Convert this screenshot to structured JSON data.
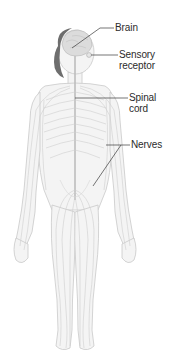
{
  "diagram": {
    "colors": {
      "background": "#ffffff",
      "body_fill": "#f4f4f4",
      "body_outline": "#c9c9c9",
      "nerve_lines": "#cfcfcf",
      "spine": "#bdbdbd",
      "brain": "#dcdcdc",
      "hair": "#6e6e6e",
      "leader_lines": "#3a3a3a",
      "label_text": "#2b2b2b"
    },
    "labels": [
      {
        "id": "brain",
        "lines": [
          "Brain"
        ]
      },
      {
        "id": "sensory-receptor",
        "lines": [
          "Sensory",
          "receptor"
        ]
      },
      {
        "id": "spinal-cord",
        "lines": [
          "Spinal",
          "cord"
        ]
      },
      {
        "id": "nerves",
        "lines": [
          "Nerves"
        ]
      }
    ]
  }
}
